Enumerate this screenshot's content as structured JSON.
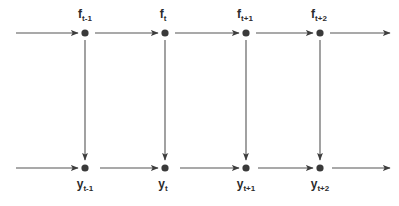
{
  "diagram": {
    "type": "state-space-graphical-model",
    "background_color": "#ffffff",
    "node_color": "#3a3a3a",
    "edge_color": "#555555",
    "label_color": "#2b2b2b",
    "rows": {
      "top": {
        "name": "latent-state-row",
        "variable_symbol": "f",
        "y": 33,
        "nodes": [
          {
            "id": "f_t-1",
            "base": "f",
            "sub": "t-1",
            "x": 85
          },
          {
            "id": "f_t",
            "base": "f",
            "sub": "t",
            "x": 165
          },
          {
            "id": "f_t+1",
            "base": "f",
            "sub": "t+1",
            "x": 246
          },
          {
            "id": "f_t+2",
            "base": "f",
            "sub": "t+2",
            "x": 320
          }
        ]
      },
      "bottom": {
        "name": "observation-row",
        "variable_symbol": "y",
        "y": 168,
        "nodes": [
          {
            "id": "y_t-1",
            "base": "y",
            "sub": "t-1",
            "x": 85
          },
          {
            "id": "y_t",
            "base": "y",
            "sub": "t",
            "x": 165
          },
          {
            "id": "y_t+1",
            "base": "y",
            "sub": "t+1",
            "x": 246
          },
          {
            "id": "y_t+2",
            "base": "y",
            "sub": "t+2",
            "x": 320
          }
        ]
      }
    },
    "horizontal_edges_top": [
      {
        "name": "edge-in-f_t-1",
        "x1": 16,
        "x2": 78
      },
      {
        "name": "edge-f_t-1-to-f_t",
        "x1": 95,
        "x2": 158
      },
      {
        "name": "edge-f_t-to-f_t+1",
        "x1": 175,
        "x2": 239
      },
      {
        "name": "edge-f_t+1-to-f_t+2",
        "x1": 256,
        "x2": 313
      },
      {
        "name": "edge-out-f_t+2",
        "x1": 330,
        "x2": 390
      }
    ],
    "horizontal_edges_bottom": [
      {
        "name": "edge-in-y_t-1",
        "x1": 16,
        "x2": 78
      },
      {
        "name": "edge-y_t-1-to-y_t",
        "x1": 100,
        "x2": 158
      },
      {
        "name": "edge-y_t-to-y_t+1",
        "x1": 180,
        "x2": 239
      },
      {
        "name": "edge-y_t+1-to-y_t+2",
        "x1": 258,
        "x2": 313
      },
      {
        "name": "edge-out-y_t+2",
        "x1": 332,
        "x2": 390
      }
    ],
    "vertical_edges": [
      {
        "name": "edge-f_t-1-to-y_t-1",
        "x": 85,
        "y1": 40,
        "y2": 160
      },
      {
        "name": "edge-f_t-to-y_t",
        "x": 165,
        "y1": 40,
        "y2": 160
      },
      {
        "name": "edge-f_t+1-to-y_t+1",
        "x": 246,
        "y1": 40,
        "y2": 160
      },
      {
        "name": "edge-f_t+2-to-y_t+2",
        "x": 320,
        "y1": 40,
        "y2": 160
      }
    ],
    "labels": {
      "top": [
        {
          "text": "f",
          "sub": "t-1",
          "x": 85,
          "y": 8
        },
        {
          "text": "f",
          "sub": "t",
          "x": 163,
          "y": 8
        },
        {
          "text": "f",
          "sub": "t+1",
          "x": 245,
          "y": 8
        },
        {
          "text": "f",
          "sub": "t+2",
          "x": 319,
          "y": 8
        }
      ],
      "bottom": [
        {
          "text": "y",
          "sub": "t-1",
          "x": 85,
          "y": 178
        },
        {
          "text": "y",
          "sub": "t",
          "x": 163,
          "y": 178
        },
        {
          "text": "y",
          "sub": "t+1",
          "x": 246,
          "y": 178
        },
        {
          "text": "y",
          "sub": "t+2",
          "x": 320,
          "y": 178
        }
      ]
    }
  }
}
